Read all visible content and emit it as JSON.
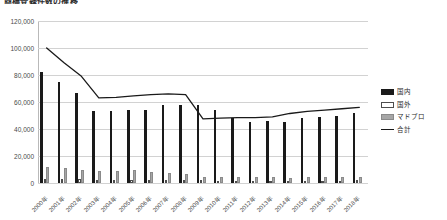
{
  "chart_data": {
    "type": "bar",
    "title": "商標登録件数の推移",
    "xlabel": "",
    "ylabel": "",
    "ylim": [
      0,
      120000
    ],
    "grid": true,
    "legend_position": "right",
    "categories": [
      "2000年",
      "2001年",
      "2002年",
      "2003年",
      "2004年",
      "2005年",
      "2006年",
      "2007年",
      "2008年",
      "2009年",
      "2010年",
      "2011年",
      "2012年",
      "2013年",
      "2014年",
      "2015年",
      "2016年",
      "2017年",
      "2018年"
    ],
    "ytick_labels": [
      "0",
      "20,000",
      "40,000",
      "60,000",
      "80,000",
      "100,000",
      "120,000"
    ],
    "ytick_values": [
      0,
      20000,
      40000,
      60000,
      80000,
      100000,
      120000
    ],
    "series": [
      {
        "name": "国内",
        "kind": "bar",
        "color": "#1a1a1a",
        "values": [
          82000,
          75000,
          67000,
          53000,
          53000,
          54000,
          54000,
          58000,
          58000,
          58000,
          54000,
          48000,
          45000,
          46000,
          45000,
          48000,
          49000,
          50000,
          52000
        ]
      },
      {
        "name": "国外",
        "kind": "bar",
        "color": "#ffffff",
        "values": [
          3200,
          3000,
          2800,
          2500,
          2400,
          2300,
          2200,
          2100,
          2000,
          1900,
          1800,
          1700,
          1700,
          1700,
          1700,
          1800,
          1800,
          1800,
          1900
        ]
      },
      {
        "name": "マドプロ",
        "kind": "bar",
        "color": "#a6a6a6",
        "values": [
          11500,
          11200,
          9500,
          9000,
          9200,
          9500,
          8200,
          7600,
          6600,
          4300,
          4400,
          4200,
          4200,
          4100,
          4000,
          4100,
          4100,
          4200,
          4300
        ]
      },
      {
        "name": "合計",
        "kind": "line",
        "color": "#1a1a1a",
        "values": [
          100000,
          89000,
          79000,
          63000,
          63500,
          64500,
          65500,
          66000,
          65500,
          47500,
          48000,
          48500,
          48500,
          49000,
          51500,
          53000,
          54000,
          55000,
          56000
        ]
      }
    ]
  }
}
